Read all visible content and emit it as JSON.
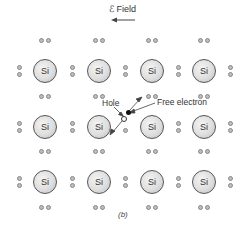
{
  "field": {
    "label": "ℰ Field",
    "direction": "left"
  },
  "atoms": {
    "symbol": "Si",
    "columns_x": [
      45,
      99,
      152,
      204
    ],
    "rows_y": [
      71,
      127,
      182
    ]
  },
  "annotations": {
    "hole_label": "Hole",
    "free_electron_label": "Free electron"
  },
  "caption": "(b)",
  "colors": {
    "atom_fill": "#dedede",
    "electron_fill": "#bdbdbd",
    "free_electron": "#111111",
    "stroke": "#555555"
  }
}
